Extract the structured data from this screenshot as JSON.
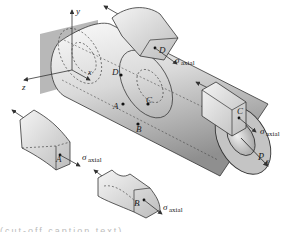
{
  "figure": {
    "axes": {
      "x": "x",
      "y": "y",
      "z": "z"
    },
    "load": {
      "symbol": "P",
      "subscript": "x"
    },
    "points": [
      "A",
      "B",
      "C",
      "D"
    ],
    "stress": {
      "symbol": "σ",
      "subscript": "axial"
    },
    "elements": [
      {
        "id": "D",
        "label": "D",
        "stress_symbol": "σ",
        "stress_sub": "axial"
      },
      {
        "id": "C",
        "label": "C",
        "stress_symbol": "σ",
        "stress_sub": "axial"
      },
      {
        "id": "A",
        "label": "A",
        "stress_symbol": "σ",
        "stress_sub": "axial"
      },
      {
        "id": "B",
        "label": "B",
        "stress_symbol": "σ",
        "stress_sub": "axial"
      }
    ],
    "caption_partial": "(cut-off caption text)"
  },
  "colors": {
    "wall": "#a9a9a9",
    "shaft_light": "#f2f2f2",
    "shaft_dark": "#9a9a9a",
    "end_face": "#c4c4c4",
    "outline": "#333333"
  }
}
